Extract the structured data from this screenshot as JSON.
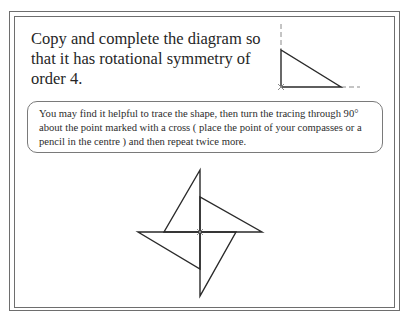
{
  "question": {
    "text": "Copy and complete the diagram so that it has rotational symmetry of order 4."
  },
  "hint": {
    "text": "You may find it helpful to trace the shape, then turn the tracing through 90° about the point marked with a cross ( place the point of your compasses or a pencil in the centre ) and then repeat twice more."
  },
  "starter_diagram": {
    "shape": "right-triangle",
    "right_angle_vertex_marker": "cross",
    "guide_lines": "dashed"
  },
  "completed_diagram": {
    "shape": "pinwheel",
    "triangles": 4,
    "center_marker": "cross",
    "rotation_degrees": 90
  },
  "colors": {
    "line": "#2a2a2a",
    "frame": "#6e6e6e",
    "dashed": "#8a8a8a",
    "cross": "#8a8a8a"
  }
}
